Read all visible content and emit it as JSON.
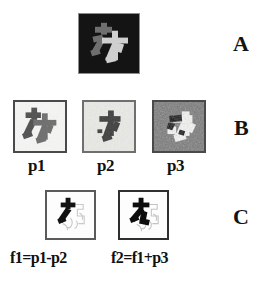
{
  "figure": {
    "type": "image-processing-panel-figure",
    "background_color": "#ffffff",
    "rows": [
      {
        "letter": "A",
        "description": "Original source image: light gray Japanese kanji glyph on a black square background"
      },
      {
        "letter": "B",
        "description": "Three observed / degraded images p1, p2, p3 derived from the source"
      },
      {
        "letter": "C",
        "description": "Two computed difference and sum images f1 and f2"
      }
    ]
  },
  "row_a": {
    "letter": "A",
    "panel": {
      "name": "original-image",
      "background_color": "#121212",
      "glyph_colors": [
        "#7a7a7a",
        "#cfcfcf"
      ],
      "border_color": "#8d8d8d"
    }
  },
  "row_b": {
    "letter": "B",
    "panels": [
      {
        "id": "p1",
        "label": "p1",
        "background_color": "#f4f4f2",
        "glyph_color": "#4d4d4d",
        "border_color": "#4a4a4a",
        "description": "dark glyph on light noisy background"
      },
      {
        "id": "p2",
        "label": "p2",
        "background_color": "#e6e6e3",
        "glyph_color": "#3f3f3f",
        "border_color": "#6f6f6f",
        "description": "dark glyph shifted, lighter mottled background"
      },
      {
        "id": "p3",
        "label": "p3",
        "background_color": "#6b6b6b",
        "glyph_color": "#f7f7f5",
        "border_color": "#4a4a4a",
        "description": "inverted: light glyph on dark heavily textured background"
      }
    ]
  },
  "row_c": {
    "letter": "C",
    "panels": [
      {
        "id": "f1",
        "label": "f1=p1-p2",
        "background_color": "#fdfdfd",
        "glyph_color": "#121212",
        "border_color": "#5a5a5a",
        "description": "difference image, partial black strokes with faint outlines"
      },
      {
        "id": "f2",
        "label": "f2=f1+p3",
        "background_color": "#fdfdfd",
        "glyph_color": "#0d0d0d",
        "border_color": "#2f2f2f",
        "description": "sum image, denser black strokes with faint outlines"
      }
    ]
  },
  "colors": {
    "page_background": "#ffffff",
    "text": "#111111",
    "row_letter": "#141414"
  }
}
